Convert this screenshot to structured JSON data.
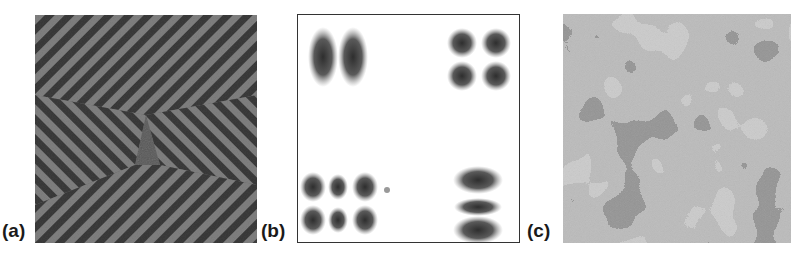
{
  "figure": {
    "panels": [
      {
        "label": "(a)",
        "description": "stripe pattern with diagonal chevron domains"
      },
      {
        "label": "(b)",
        "description": "localized spot clusters in four corners"
      },
      {
        "label": "(c)",
        "description": "labyrinthine multi-gray domain pattern"
      }
    ]
  },
  "colors": {
    "stripe_dark": "#3a3a3a",
    "stripe_light": "#7a7a7a",
    "spot": "#4a4a4a",
    "frame": "#333333"
  }
}
